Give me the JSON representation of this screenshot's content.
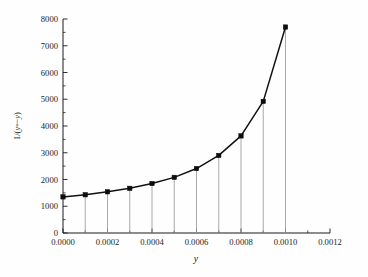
{
  "chart_data": {
    "type": "line",
    "title": "",
    "subtitle": "",
    "xlabel": "y",
    "ylabel": "1/(y*−y)",
    "xlim": [
      0.0,
      0.0012
    ],
    "ylim": [
      0,
      8000
    ],
    "grid": false,
    "legend": "none",
    "marker": "filled-square",
    "droplines": true,
    "x": [
      0.0,
      0.0001,
      0.0002,
      0.0003,
      0.0004,
      0.0005,
      0.0006,
      0.0007,
      0.0008,
      0.0009,
      0.001
    ],
    "values": [
      1350,
      1430,
      1540,
      1670,
      1850,
      2080,
      2410,
      2900,
      3630,
      4920,
      7700
    ],
    "series": [
      {
        "name": "1/(y*−y)",
        "values": [
          1350,
          1430,
          1540,
          1670,
          1850,
          2080,
          2410,
          2900,
          3630,
          4920,
          7700
        ]
      }
    ],
    "xticks": [
      0.0,
      0.0002,
      0.0004,
      0.0006,
      0.0008,
      0.001,
      0.0012
    ],
    "xtick_labels": [
      "0.0000",
      "0.0002",
      "0.0004",
      "0.0006",
      "0.0008",
      "0.0010",
      "0.0012"
    ],
    "yticks": [
      0,
      1000,
      2000,
      3000,
      4000,
      5000,
      6000,
      7000,
      8000
    ],
    "ytick_labels": [
      "0",
      "1000",
      "2000",
      "3000",
      "4000",
      "5000",
      "6000",
      "7000",
      "8000"
    ],
    "x_minor_step": 0.0001,
    "y_minor_step": 500,
    "colors": {
      "line": "#111111",
      "marker": "#0d0d0d",
      "dropline": "#9a9a9a",
      "axis": "#1a1a1a",
      "background": "#fefefe"
    }
  },
  "axis_labels": {
    "x_title": "y",
    "y_title_parts": {
      "prefix": "1/(",
      "var1": "y",
      "star": "*",
      "minus": "−",
      "var2": "y",
      "suffix": ")"
    }
  }
}
